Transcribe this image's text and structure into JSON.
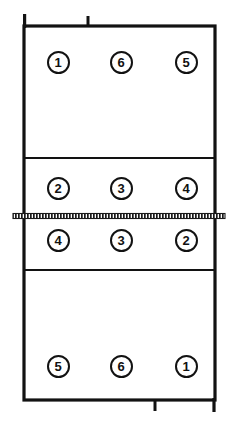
{
  "diagram": {
    "type": "volleyball-court-rotation",
    "width": 232,
    "height": 430,
    "colors": {
      "line": "#121212",
      "net": "#1a1a1a",
      "background": "#ffffff",
      "marker_fill": "#ffffff",
      "marker_stroke": "#121212",
      "number_text": "#111111"
    },
    "court": {
      "left": 24,
      "right": 215,
      "top": 26,
      "bottom": 400,
      "border_width": 3.2
    },
    "net": {
      "y": 216,
      "x_start": 13,
      "x_end": 225,
      "thickness": 5,
      "style": "hatched"
    },
    "attack_lines": [
      {
        "name": "attack-line-far",
        "y": 158,
        "thickness": 2.2
      },
      {
        "name": "attack-line-near",
        "y": 270,
        "thickness": 2.2
      }
    ],
    "service_ticks": [
      {
        "name": "service-tick-top",
        "x": 88,
        "y": 26,
        "length": 11,
        "direction": "up"
      },
      {
        "name": "service-tick-bottom",
        "x": 155,
        "y": 400,
        "length": 11,
        "direction": "down"
      }
    ],
    "corner_extension": {
      "name": "corner-extension-top-left",
      "x": 24,
      "y_top": 14,
      "y_bottom": 26
    },
    "columns": [
      {
        "name": "column-left",
        "x": 58
      },
      {
        "name": "column-center",
        "x": 121
      },
      {
        "name": "column-right",
        "x": 186
      }
    ],
    "rows": [
      {
        "name": "row-far-back",
        "y": 62
      },
      {
        "name": "row-far-front",
        "y": 188
      },
      {
        "name": "row-near-front",
        "y": 240
      },
      {
        "name": "row-near-back",
        "y": 366
      }
    ]
  },
  "players": [
    {
      "id": "far-back-left",
      "label": "1",
      "x": 58,
      "y": 62,
      "zone": "far-back-row"
    },
    {
      "id": "far-back-center",
      "label": "6",
      "x": 121,
      "y": 62,
      "zone": "far-back-row"
    },
    {
      "id": "far-back-right",
      "label": "5",
      "x": 186,
      "y": 62,
      "zone": "far-back-row"
    },
    {
      "id": "far-front-left",
      "label": "2",
      "x": 58,
      "y": 188,
      "zone": "far-front-row"
    },
    {
      "id": "far-front-center",
      "label": "3",
      "x": 121,
      "y": 188,
      "zone": "far-front-row"
    },
    {
      "id": "far-front-right",
      "label": "4",
      "x": 186,
      "y": 188,
      "zone": "far-front-row"
    },
    {
      "id": "near-front-left",
      "label": "4",
      "x": 58,
      "y": 240,
      "zone": "near-front-row"
    },
    {
      "id": "near-front-center",
      "label": "3",
      "x": 121,
      "y": 240,
      "zone": "near-front-row"
    },
    {
      "id": "near-front-right",
      "label": "2",
      "x": 186,
      "y": 240,
      "zone": "near-front-row"
    },
    {
      "id": "near-back-left",
      "label": "5",
      "x": 58,
      "y": 366,
      "zone": "near-back-row"
    },
    {
      "id": "near-back-center",
      "label": "6",
      "x": 121,
      "y": 366,
      "zone": "near-back-row"
    },
    {
      "id": "near-back-right",
      "label": "1",
      "x": 186,
      "y": 366,
      "zone": "near-back-row"
    }
  ]
}
